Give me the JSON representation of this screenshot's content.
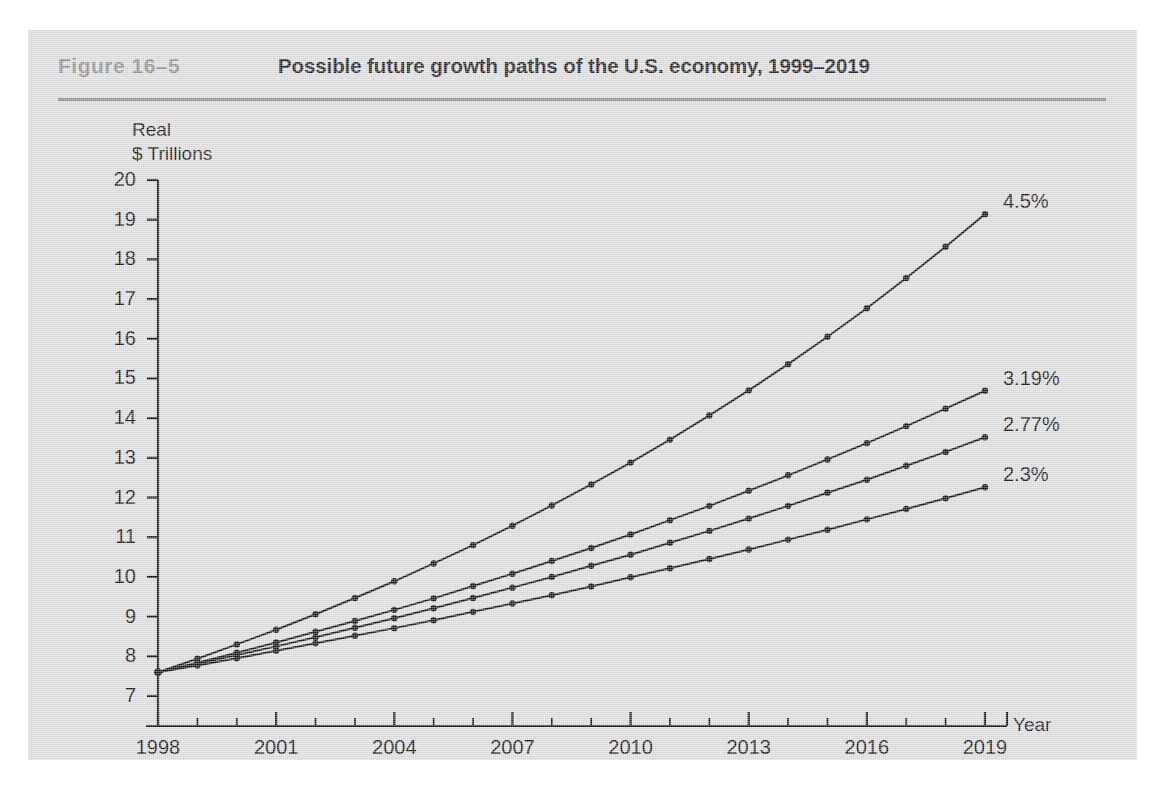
{
  "figure": {
    "number": "Figure  16–5",
    "title": "Possible future growth paths of the U.S. economy, 1999–2019"
  },
  "chart_data": {
    "type": "line",
    "title": "Possible future growth paths of the U.S. economy, 1999–2019",
    "xlabel": "Year",
    "ylabel": "Real $ Trillions",
    "xlim": [
      1998,
      2019
    ],
    "ylim": [
      7,
      20
    ],
    "grid": false,
    "legend_position": "right-end-of-line",
    "y_ticks": [
      7,
      8,
      9,
      10,
      11,
      12,
      13,
      14,
      15,
      16,
      17,
      18,
      19,
      20
    ],
    "y_tick_labels": [
      "7",
      "8",
      "9",
      "10",
      "11",
      "12",
      "13",
      "14",
      "15",
      "16",
      "17",
      "18",
      "19",
      "20"
    ],
    "x_ticks": [
      1998,
      1999,
      2000,
      2001,
      2002,
      2003,
      2004,
      2005,
      2006,
      2007,
      2008,
      2009,
      2010,
      2011,
      2012,
      2013,
      2014,
      2015,
      2016,
      2017,
      2018,
      2019
    ],
    "x_tick_labels_major": [
      "1998",
      "2001",
      "2004",
      "2007",
      "2010",
      "2013",
      "2016",
      "2019"
    ],
    "x_ticks_major": [
      1998,
      2001,
      2004,
      2007,
      2010,
      2013,
      2016,
      2019
    ],
    "x": [
      1998,
      1999,
      2000,
      2001,
      2002,
      2003,
      2004,
      2005,
      2006,
      2007,
      2008,
      2009,
      2010,
      2011,
      2012,
      2013,
      2014,
      2015,
      2016,
      2017,
      2018,
      2019
    ],
    "start_value": 7.6,
    "line_color": "#111111",
    "marker": "circle",
    "series": [
      {
        "name": "4.5%",
        "label": "4.5%",
        "growth_rate_percent": 4.5,
        "values": [
          7.6,
          7.94,
          8.3,
          8.67,
          9.06,
          9.47,
          9.89,
          10.34,
          10.8,
          11.29,
          11.8,
          12.33,
          12.88,
          13.46,
          14.07,
          14.7,
          15.36,
          16.05,
          16.77,
          17.53,
          18.32,
          19.14
        ]
      },
      {
        "name": "3.19%",
        "label": "3.19%",
        "growth_rate_percent": 3.19,
        "values": [
          7.6,
          7.84,
          8.09,
          8.35,
          8.62,
          8.89,
          9.17,
          9.46,
          9.77,
          10.08,
          10.4,
          10.73,
          11.07,
          11.43,
          11.79,
          12.17,
          12.56,
          12.96,
          13.37,
          13.8,
          14.24,
          14.69
        ]
      },
      {
        "name": "2.77%",
        "label": "2.77%",
        "growth_rate_percent": 2.77,
        "values": [
          7.6,
          7.81,
          8.03,
          8.25,
          8.48,
          8.72,
          8.96,
          9.21,
          9.47,
          9.73,
          10.0,
          10.28,
          10.56,
          10.86,
          11.16,
          11.47,
          11.79,
          12.12,
          12.45,
          12.8,
          13.15,
          13.52
        ]
      },
      {
        "name": "2.3%",
        "label": "2.3%",
        "growth_rate_percent": 2.3,
        "values": [
          7.6,
          7.77,
          7.95,
          8.14,
          8.33,
          8.52,
          8.71,
          8.91,
          9.12,
          9.33,
          9.54,
          9.76,
          9.99,
          10.22,
          10.45,
          10.69,
          10.94,
          11.19,
          11.45,
          11.71,
          11.98,
          12.26
        ]
      }
    ]
  },
  "colors": {
    "panel_background": "#dcdcdc",
    "figure_number": "#8d8d8d",
    "rule": "#8a8a8a",
    "axis": "#111111",
    "text": "#111111"
  }
}
